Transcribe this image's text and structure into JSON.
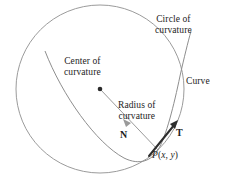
{
  "figure": {
    "background_color": "#ffffff",
    "labels": {
      "circle_of_curvature_line1": "Circle of",
      "circle_of_curvature_line2": "curvature",
      "center_of_curvature_line1": "Center of",
      "center_of_curvature_line2": "curvature",
      "radius_of_curvature_line1": "Radius of",
      "radius_of_curvature_line2": "curvature",
      "curve": "Curve",
      "normal_vector": "N",
      "tangent_vector": "T",
      "point_p_prefix": "P",
      "point_p_open": "(",
      "point_p_x": "x",
      "point_p_comma": ", ",
      "point_p_y": "y",
      "point_p_close": ")"
    },
    "colors": {
      "circle_stroke": "#9b9b9b",
      "curve_stroke": "#8e8e8e",
      "radius_stroke": "#9a9a9a",
      "tangent_stroke": "#2e2e2e",
      "center_dot": "#2b2b2b",
      "text": "#1c1c1c"
    },
    "geometry": {
      "center_of_curvature_point": [
        100,
        89
      ],
      "point_p": [
        158,
        150
      ],
      "circle_radius": 84,
      "tangent_tip": [
        178,
        120
      ],
      "normal_arrow_tip": [
        130,
        122
      ]
    }
  }
}
